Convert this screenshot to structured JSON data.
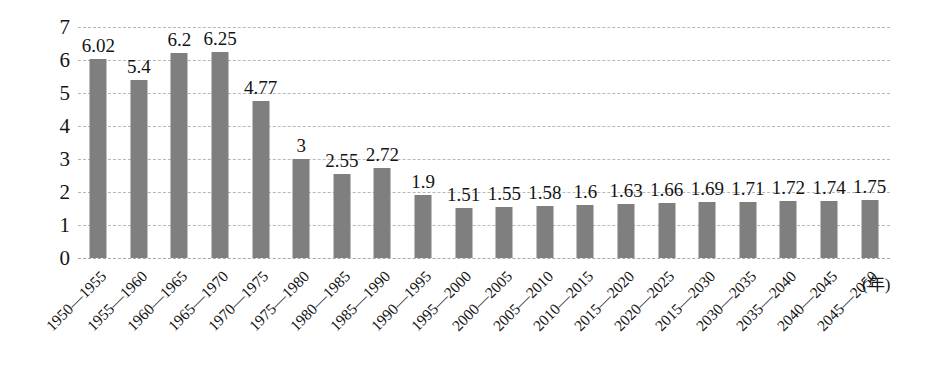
{
  "chart_data": {
    "type": "bar",
    "title": "",
    "xlabel": "(年)",
    "ylabel": "",
    "ylim": [
      0,
      7
    ],
    "yticks": [
      0,
      1,
      2,
      3,
      4,
      5,
      6,
      7
    ],
    "grid": true,
    "legend": false,
    "bar_color": "#807f7f",
    "categories": [
      "1950—1955",
      "1955—1960",
      "1960—1965",
      "1965—1970",
      "1970—1975",
      "1975—1980",
      "1980—1985",
      "1985—1990",
      "1990—1995",
      "1995—2000",
      "2000—2005",
      "2005—2010",
      "2010—2015",
      "2015—2020",
      "2020—2025",
      "2015—2030",
      "2030—2035",
      "2035—2040",
      "2040—2045",
      "2045—2050"
    ],
    "values": [
      6.02,
      5.4,
      6.2,
      6.25,
      4.77,
      3,
      2.55,
      2.72,
      1.9,
      1.51,
      1.55,
      1.58,
      1.6,
      1.63,
      1.66,
      1.69,
      1.71,
      1.72,
      1.74,
      1.75
    ],
    "value_labels": [
      "6.02",
      "5.4",
      "6.2",
      "6.25",
      "4.77",
      "3",
      "2.55",
      "2.72",
      "1.9",
      "1.51",
      "1.55",
      "1.58",
      "1.6",
      "1.63",
      "1.66",
      "1.69",
      "1.71",
      "1.72",
      "1.74",
      "1.75"
    ]
  }
}
